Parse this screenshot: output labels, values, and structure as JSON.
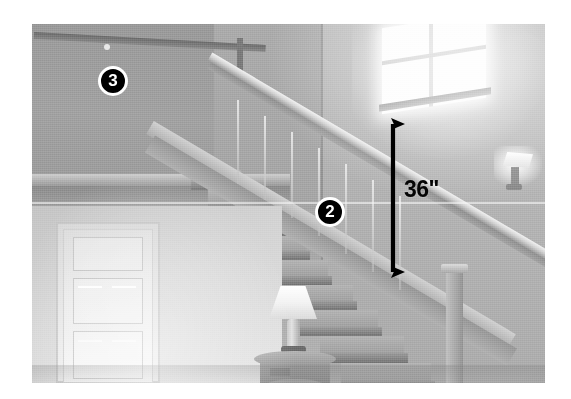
{
  "photo": {
    "description": "Grayscale interior photograph of a residential staircase and second-floor landing",
    "frame": {
      "left": 32,
      "top": 24,
      "width": 513,
      "height": 359,
      "background": "#ffffff"
    }
  },
  "annotations": {
    "badges": [
      {
        "id": "badge-3",
        "label": "3",
        "x": 113,
        "y": 81,
        "diameter": 30,
        "fill": "#000000",
        "ring": "#ffffff",
        "text_color": "#ffffff",
        "refers_to": "upper-landing-guardrail"
      },
      {
        "id": "badge-2",
        "label": "2",
        "x": 330,
        "y": 212,
        "diameter": 30,
        "fill": "#000000",
        "ring": "#ffffff",
        "text_color": "#ffffff",
        "refers_to": "stair-handrail"
      }
    ],
    "dimension": {
      "id": "dimension-36-inches",
      "label": "36\"",
      "value": 36,
      "unit": "inches",
      "arrow_color": "#000000",
      "label_color": "#050505",
      "arrow_x": 392,
      "arrow_top": 114,
      "arrow_bottom": 279,
      "label_x": 404,
      "label_y": 178
    }
  },
  "scene": {
    "elements": [
      {
        "name": "upper-landing-guardrail",
        "label": "Upper landing guardrail"
      },
      {
        "name": "stair-handrail",
        "label": "Stair handrail"
      },
      {
        "name": "staircase",
        "label": "Staircase with treads and risers"
      },
      {
        "name": "window",
        "label": "Window with muntins"
      },
      {
        "name": "wall-sconce",
        "label": "Wall sconce light"
      },
      {
        "name": "panel-door",
        "label": "White panel door"
      },
      {
        "name": "table-lamp",
        "label": "Table lamp"
      },
      {
        "name": "side-table",
        "label": "Round side table"
      },
      {
        "name": "newel-post",
        "label": "Newel post"
      }
    ]
  },
  "palette": {
    "page_background": "#ffffff",
    "photo_mid_gray": "#b0b0b0",
    "photo_dark_gray": "#787878",
    "photo_light_gray": "#e6e6e6",
    "annotation_black": "#000000",
    "annotation_white": "#ffffff"
  }
}
